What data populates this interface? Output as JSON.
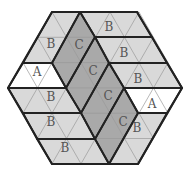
{
  "diagram": {
    "colors": {
      "A": "#ffffff",
      "B": "#d9d9d9",
      "C": "#a9a9a9",
      "grid_line": "#9a9a9a",
      "piece_border": "#222222",
      "label": "#555555"
    },
    "pieces": [
      {
        "type": "B",
        "points": "52,12 80,12 52,63 23,63",
        "label": "B",
        "lx": 51,
        "ly": 44
      },
      {
        "type": "A",
        "points": "23,63 52,63 66,88 8,88",
        "label": "A",
        "lx": 37,
        "ly": 72
      },
      {
        "type": "B",
        "points": "8,88 66,88 81,113 23,113",
        "label": "B",
        "lx": 51,
        "ly": 97
      },
      {
        "type": "B",
        "points": "23,113 81,113 95,139 37,139",
        "label": "B",
        "lx": 51,
        "ly": 122
      },
      {
        "type": "B",
        "points": "37,139 95,139 109,164 52,164",
        "label": "B",
        "lx": 65,
        "ly": 148
      },
      {
        "type": "C",
        "points": "80,12 95,37 66,88 52,63",
        "label": "C",
        "lx": 79,
        "ly": 45
      },
      {
        "type": "C",
        "points": "95,37 109,63 81,113 66,88",
        "label": "C",
        "lx": 93,
        "ly": 71
      },
      {
        "type": "C",
        "points": "109,63 124,88 95,139 81,113",
        "label": "C",
        "lx": 108,
        "ly": 96
      },
      {
        "type": "C",
        "points": "124,88 138,113 109,164 95,139",
        "label": "C",
        "lx": 123,
        "ly": 122
      },
      {
        "type": "B",
        "points": "80,12 137,12 152,37 95,37",
        "label": "B",
        "lx": 109,
        "ly": 27
      },
      {
        "type": "B",
        "points": "95,37 152,37 167,63 109,63",
        "label": "B",
        "lx": 124,
        "ly": 53
      },
      {
        "type": "B",
        "points": "109,63 167,63 182,88 124,88",
        "label": "B",
        "lx": 138,
        "ly": 79
      },
      {
        "type": "A",
        "points": "124,88 182,88 167,113 138,113",
        "label": "A",
        "lx": 152,
        "ly": 104
      },
      {
        "type": "B",
        "points": "138,113 167,113 138,164 109,164",
        "label": "B",
        "lx": 137,
        "ly": 128
      }
    ]
  }
}
